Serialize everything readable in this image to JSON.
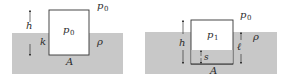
{
  "colors": {
    "background": "#ffffff",
    "fluid": "#c8c8c8",
    "box_fill": "#ffffff",
    "stroke": "#333333",
    "text": "#2a2a2a"
  },
  "left_panel": {
    "title": "open container floating",
    "labels": {
      "height": "h",
      "depth": "k",
      "inner_pressure": "p",
      "inner_pressure_sub": "0",
      "outer_pressure": "p",
      "outer_pressure_sub": "0",
      "density": "ρ",
      "area": "A"
    }
  },
  "right_panel": {
    "title": "inverted container with trapped air",
    "labels": {
      "height": "h",
      "inner_pressure": "p",
      "inner_pressure_sub": "1",
      "outer_pressure": "p",
      "outer_pressure_sub": "0",
      "density": "ρ",
      "submerged_depth": "ℓ",
      "rise": "s",
      "area": "A"
    }
  }
}
